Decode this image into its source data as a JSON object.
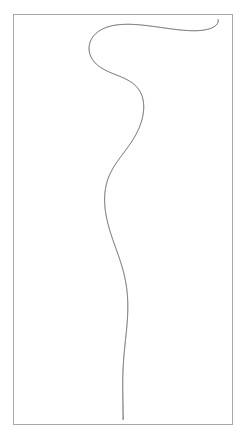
{
  "page": {
    "width": 246,
    "height": 440,
    "background_color": "#ffffff"
  },
  "frame": {
    "name": "plate-border",
    "x": 13,
    "y": 14,
    "width": 220,
    "height": 411,
    "stroke_color": "#a8a8a8",
    "stroke_width": 1
  },
  "figure": {
    "name": "harmonograph-curve",
    "stroke_color": "#1a1a1a",
    "stroke_width": 0.7,
    "fill": "none",
    "symmetry_axis_x": 123
  },
  "chart_data": {
    "type": "line",
    "title": "",
    "subtitle": "",
    "xlabel": "",
    "ylabel": "",
    "grid": false,
    "legend": null,
    "axis_visible": false,
    "xlim": [
      13,
      233
    ],
    "ylim": [
      14,
      425
    ],
    "parametric": {
      "model": "damped-harmonograph",
      "center_x": 123,
      "center_y": 219.5,
      "x_amplitude": 99,
      "y_amplitude": 200,
      "x_frequency": 1.0,
      "y_frequency": 6.02,
      "x_phase_deg": 0,
      "y_phase_deg": 90,
      "x_damping": 0.0,
      "y_damping": 0.0,
      "envelope_damping": 0.0062,
      "t_start": 0,
      "t_end": 37.7,
      "sample_count": 4200
    },
    "key_features": [
      {
        "name": "apex-node",
        "x": 123,
        "y": 25
      },
      {
        "name": "top-lobe-left-extreme",
        "x": 26,
        "y": 53
      },
      {
        "name": "top-lobe-right-extreme",
        "x": 221,
        "y": 53
      },
      {
        "name": "node-1",
        "x": 123,
        "y": 90
      },
      {
        "name": "lobe-2-left-extreme",
        "x": 31,
        "y": 107
      },
      {
        "name": "lobe-2-right-extreme",
        "x": 216,
        "y": 107
      },
      {
        "name": "node-2",
        "x": 123,
        "y": 148
      },
      {
        "name": "node-3",
        "x": 123,
        "y": 178
      },
      {
        "name": "lobe-3-left-extreme",
        "x": 26,
        "y": 211
      },
      {
        "name": "lobe-3-right-extreme",
        "x": 221,
        "y": 211
      },
      {
        "name": "inner-small-loop-center",
        "x": 123,
        "y": 216
      },
      {
        "name": "node-4",
        "x": 123,
        "y": 247
      },
      {
        "name": "node-5",
        "x": 123,
        "y": 287
      },
      {
        "name": "horizontal-chord-left",
        "x": 48,
        "y": 307
      },
      {
        "name": "horizontal-chord-right",
        "x": 200,
        "y": 305
      },
      {
        "name": "node-6",
        "x": 123,
        "y": 345
      },
      {
        "name": "node-7",
        "x": 123,
        "y": 386
      },
      {
        "name": "base-flare-left",
        "x": 100,
        "y": 418
      },
      {
        "name": "base-flare-right",
        "x": 148,
        "y": 418
      }
    ],
    "series": [
      {
        "name": "harmonograph-trace",
        "point_count": 4200,
        "closed": false,
        "color": "#1a1a1a"
      }
    ]
  }
}
